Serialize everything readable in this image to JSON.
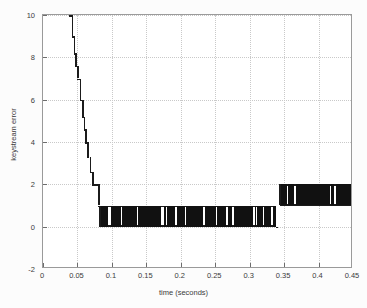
{
  "chart_data": {
    "type": "line",
    "title": "",
    "xlabel": "time (seconds)",
    "ylabel": "keystream error",
    "xlim": [
      0,
      0.45
    ],
    "ylim": [
      -2,
      10
    ],
    "grid": true,
    "legend": null,
    "xticks": [
      "0",
      "0.05",
      "0.1",
      "0.15",
      "0.2",
      "0.25",
      "0.3",
      "0.35",
      "0.4",
      "0.45"
    ],
    "xtick_values": [
      0,
      0.05,
      0.1,
      0.15,
      0.2,
      0.25,
      0.3,
      0.35,
      0.4,
      0.45
    ],
    "yticks": [
      "10",
      "8",
      "6",
      "4",
      "2",
      "0",
      "-2"
    ],
    "ytick_values": [
      10,
      8,
      6,
      4,
      2,
      0,
      -2
    ],
    "series": [
      {
        "name": "keystream error",
        "style": "stairstep",
        "color": "#111111",
        "description": "Stepped decay from 10 at t=0.038 down to 1 by t=0.083, then rapid binary oscillation between 0 and 1 until t=0.338, then a band oscillating between 1 and 2 out to t=0.45",
        "x": [
          0.038,
          0.042,
          0.045,
          0.048,
          0.051,
          0.054,
          0.057,
          0.06,
          0.063,
          0.066,
          0.069,
          0.072,
          0.075,
          0.078,
          0.083,
          0.338,
          0.45
        ],
        "y": [
          10,
          9,
          8,
          7.5,
          7,
          6,
          5,
          4,
          3.5,
          3,
          2.5,
          2,
          2,
          1.5,
          1,
          0.5,
          1.5
        ]
      }
    ],
    "decay_steps": [
      {
        "t": 0.038,
        "value": 10
      },
      {
        "t": 0.0415,
        "value": 9
      },
      {
        "t": 0.0445,
        "value": 8.2
      },
      {
        "t": 0.047,
        "value": 7.6
      },
      {
        "t": 0.05,
        "value": 7.0
      },
      {
        "t": 0.0535,
        "value": 6.0
      },
      {
        "t": 0.0565,
        "value": 5.2
      },
      {
        "t": 0.059,
        "value": 4.6
      },
      {
        "t": 0.0615,
        "value": 4.0
      },
      {
        "t": 0.0645,
        "value": 3.3
      },
      {
        "t": 0.0675,
        "value": 2.6
      },
      {
        "t": 0.0715,
        "value": 2.0
      },
      {
        "t": 0.08,
        "value": 1.0
      }
    ],
    "oscillation_low_band": {
      "t_start": 0.083,
      "t_end": 0.338,
      "y_min": 0,
      "y_max": 1
    },
    "oscillation_high_band": {
      "t_start": 0.344,
      "t_end": 0.45,
      "y_min": 1,
      "y_max": 2
    }
  },
  "figure": {
    "background": "#ffffff",
    "axis_color": "#6d6d6d",
    "grid_color": "#c9c9c9",
    "data_color": "#111111"
  }
}
